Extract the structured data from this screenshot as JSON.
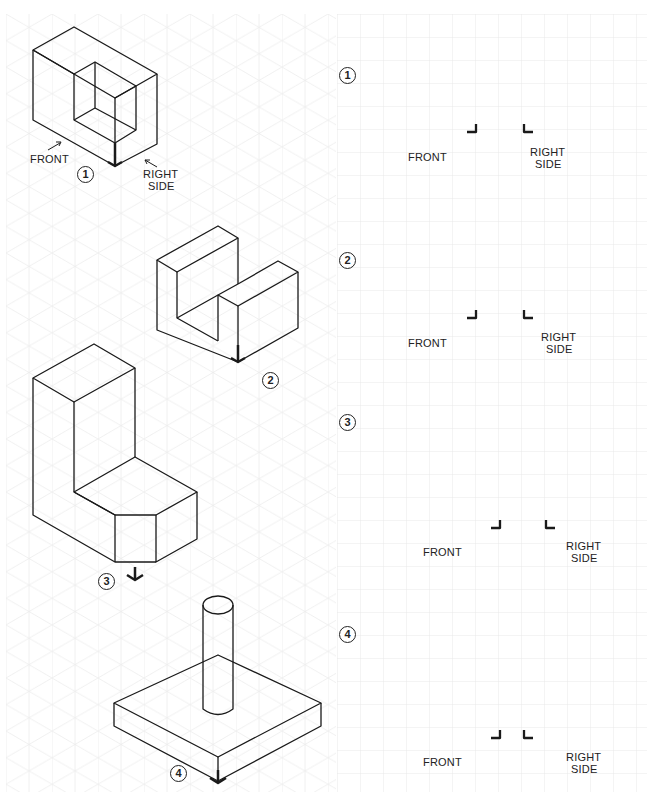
{
  "worksheet": {
    "left_grid": "isometric",
    "right_grid": "square",
    "grid_color": "#e6e6e6",
    "line_color": "#1a1a1a",
    "problems": [
      {
        "number": "1",
        "iso_labels": {
          "front": "FRONT",
          "right_line1": "RIGHT",
          "right_line2": "SIDE"
        },
        "view_labels": {
          "front": "FRONT",
          "right_line1": "RIGHT",
          "right_line2": "SIDE"
        }
      },
      {
        "number": "2",
        "view_labels": {
          "front": "FRONT",
          "right_line1": "RIGHT",
          "right_line2": "SIDE"
        }
      },
      {
        "number": "3",
        "view_labels": {
          "front": "FRONT",
          "right_line1": "RIGHT",
          "right_line2": "SIDE"
        }
      },
      {
        "number": "4",
        "view_labels": {
          "front": "FRONT",
          "right_line1": "RIGHT",
          "right_line2": "SIDE"
        }
      }
    ]
  }
}
